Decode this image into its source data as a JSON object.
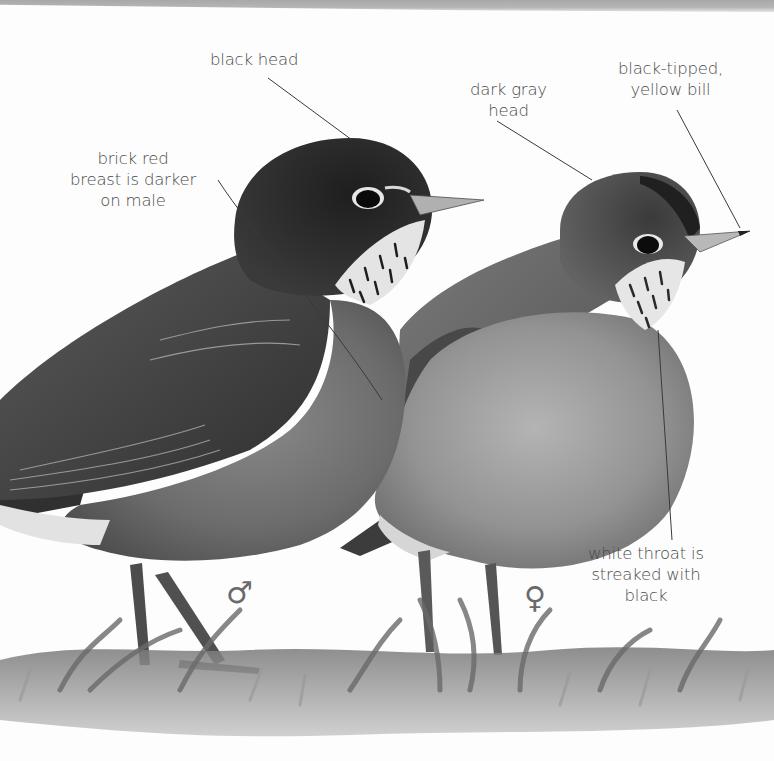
{
  "figure": {
    "palette": {
      "background": "#fdfdfd",
      "label_text": "#4a4a4a",
      "leader_line": "#3a3a3a",
      "dark_head": "#2a2a2a",
      "gray_head": "#4e4e4e",
      "breast_male": "#6a6a6a",
      "breast_female": "#8e8e8e",
      "grass": "#8a8a8a"
    },
    "annotations": [
      {
        "id": "black-head",
        "lines": [
          "black head"
        ]
      },
      {
        "id": "dark-gray-head",
        "lines": [
          "dark gray",
          "head"
        ]
      },
      {
        "id": "bill",
        "lines": [
          "black-tipped,",
          "yellow bill"
        ]
      },
      {
        "id": "breast",
        "lines": [
          "brick red",
          "breast is darker",
          "on male"
        ]
      },
      {
        "id": "throat",
        "lines": [
          "white throat is",
          "streaked with",
          "black"
        ]
      }
    ],
    "sex_symbols": {
      "male": "♂",
      "female": "♀"
    }
  }
}
